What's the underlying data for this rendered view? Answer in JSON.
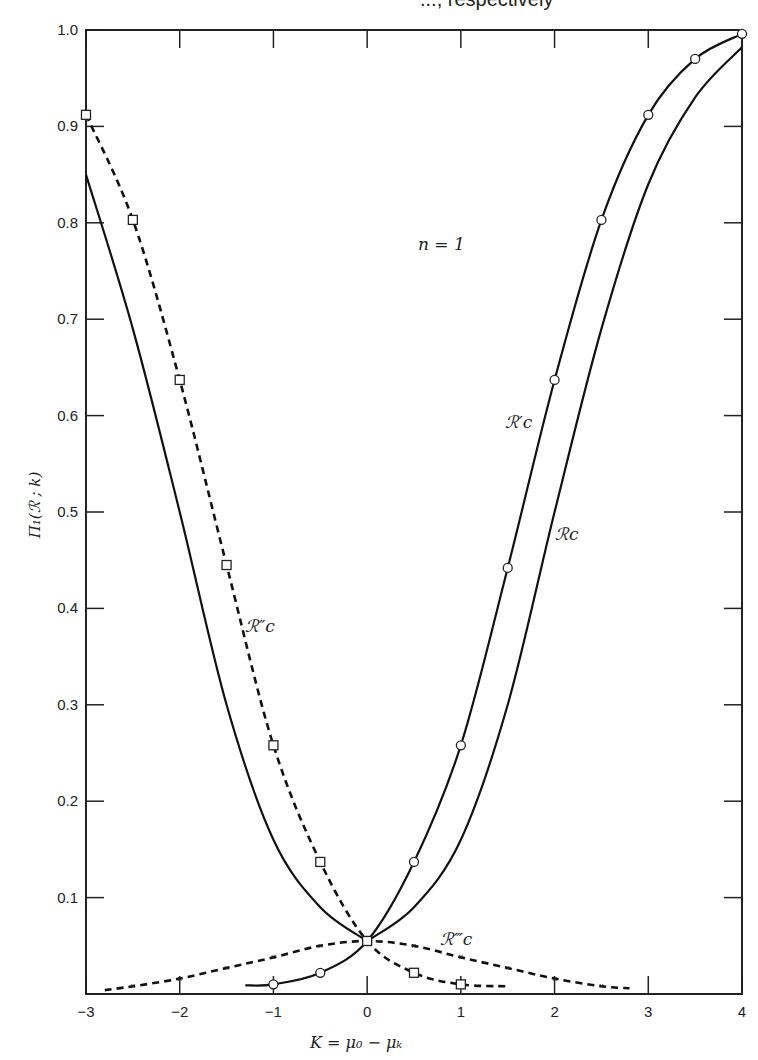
{
  "header": {
    "cut_off_text": "..., respectively"
  },
  "annotation": {
    "n_label": "n = 1"
  },
  "axes": {
    "ylabel": "Π₁(ℛ ; k)",
    "xlabel": "K = μ₀ − μₖ"
  },
  "curve_labels": {
    "rc_prime": "ℛ′c",
    "rc": "ℛc",
    "rc_double_prime": "ℛ″c",
    "rc_triple_prime": "ℛ‴c"
  },
  "chart_data": {
    "type": "line",
    "title": "",
    "annotation": "n = 1",
    "xlabel": "K = μ0 − μk",
    "ylabel": "Π1(ℛ ; k)",
    "xlim": [
      -3,
      4
    ],
    "ylim": [
      0,
      1.0
    ],
    "xticks": [
      -3,
      -2,
      -1,
      0,
      1,
      2,
      3,
      4
    ],
    "yticks": [
      0.1,
      0.2,
      0.3,
      0.4,
      0.5,
      0.6,
      0.7,
      0.8,
      0.9,
      1.0
    ],
    "grid": false,
    "legend": "inline curve labels",
    "series": [
      {
        "name": "ℛ'c",
        "style": "solid",
        "marker": "circle",
        "x": [
          -1.3,
          -1,
          -0.5,
          0,
          0.5,
          1,
          1.5,
          2,
          2.5,
          3,
          3.5,
          4
        ],
        "y": [
          0.009,
          0.01,
          0.022,
          0.055,
          0.137,
          0.258,
          0.442,
          0.637,
          0.803,
          0.912,
          0.97,
          0.996
        ],
        "marker_x": [
          -1,
          -0.5,
          0,
          0.5,
          1,
          1.5,
          2,
          2.5,
          3,
          3.5,
          4
        ]
      },
      {
        "name": "ℛc",
        "style": "solid",
        "marker": "none",
        "x": [
          0,
          0.5,
          1,
          1.5,
          2,
          2.5,
          3,
          3.5,
          4
        ],
        "y": [
          0.055,
          0.09,
          0.16,
          0.3,
          0.5,
          0.69,
          0.84,
          0.93,
          0.982
        ]
      },
      {
        "name": "ℛc (left branch)",
        "style": "solid",
        "marker": "none",
        "x": [
          -3,
          -2.5,
          -2,
          -1.5,
          -1,
          -0.5,
          0
        ],
        "y": [
          0.85,
          0.69,
          0.5,
          0.3,
          0.16,
          0.09,
          0.055
        ]
      },
      {
        "name": "ℛ''c",
        "style": "dashed",
        "marker": "square",
        "x": [
          -3,
          -2.5,
          -2,
          -1.5,
          -1,
          -0.5,
          0,
          0.5,
          1,
          1.5
        ],
        "y": [
          0.912,
          0.803,
          0.637,
          0.445,
          0.258,
          0.137,
          0.055,
          0.022,
          0.01,
          0.008
        ],
        "marker_x": [
          -3,
          -2.5,
          -2,
          -1.5,
          -1,
          -0.5,
          0,
          0.5,
          1
        ]
      },
      {
        "name": "ℛ'''c",
        "style": "dashed",
        "marker": "x",
        "x": [
          -2.8,
          -2.5,
          -2,
          -1.5,
          -1,
          -0.5,
          0,
          0.5,
          1,
          1.5,
          2,
          2.5,
          2.8
        ],
        "y": [
          0.004,
          0.008,
          0.016,
          0.027,
          0.038,
          0.05,
          0.055,
          0.05,
          0.038,
          0.027,
          0.016,
          0.008,
          0.006
        ],
        "marker_x": [
          -2.5,
          -2,
          -1.5,
          -1,
          -0.5,
          0.5,
          1,
          1.5,
          2,
          2.5
        ]
      }
    ]
  }
}
